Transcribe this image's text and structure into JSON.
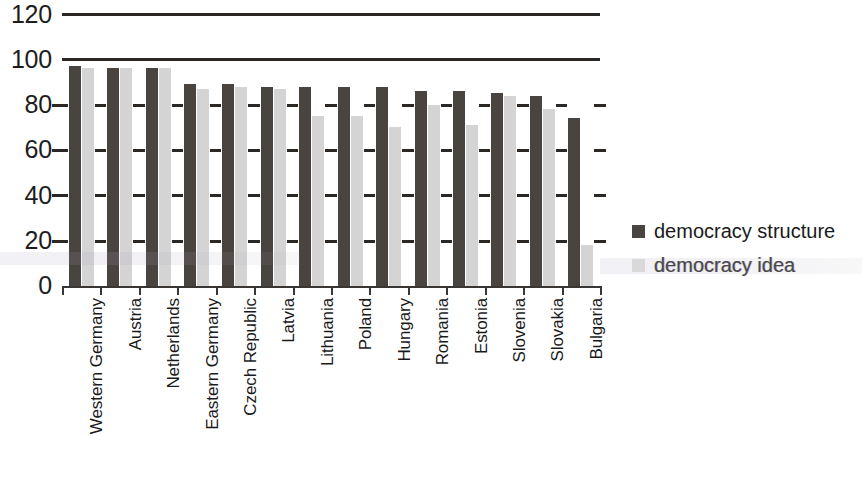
{
  "chart_data": {
    "type": "bar",
    "title": "",
    "xlabel": "",
    "ylabel": "",
    "ylim": [
      0,
      120
    ],
    "yticks": [
      0,
      20,
      40,
      60,
      80,
      100,
      120
    ],
    "grid": true,
    "legend_position": "right",
    "categories": [
      "Western Germany",
      "Austria",
      "Netherlands",
      "Eastern Germany",
      "Czech Republic",
      "Latvia",
      "Lithuania",
      "Poland",
      "Hungary",
      "Romania",
      "Estonia",
      "Slovenia",
      "Slovakia",
      "Bulgaria"
    ],
    "series": [
      {
        "name": "democracy structure",
        "color": "#4a4440",
        "values": [
          97,
          96,
          96,
          89,
          89,
          88,
          88,
          88,
          88,
          86,
          86,
          85,
          84,
          74
        ]
      },
      {
        "name": "democracy idea",
        "color": "#d4d4d4",
        "values": [
          96,
          96,
          96,
          87,
          88,
          87,
          75,
          75,
          70,
          80,
          71,
          84,
          78,
          18
        ]
      }
    ]
  },
  "legend": {
    "entries": [
      {
        "label": "democracy structure"
      },
      {
        "label": "democracy idea"
      }
    ]
  },
  "axis": {
    "y_tick_labels": [
      "120",
      "100",
      "80",
      "60",
      "40",
      "20",
      "0"
    ]
  }
}
